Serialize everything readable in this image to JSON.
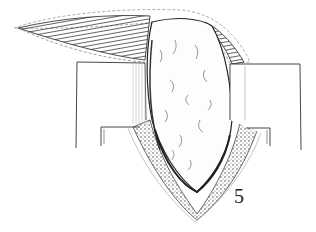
{
  "figure": {
    "label": "5",
    "colors": {
      "background": "#ffffff",
      "ink": "#1a1a1a",
      "hatch": "#333333",
      "light_line": "#999999"
    }
  }
}
